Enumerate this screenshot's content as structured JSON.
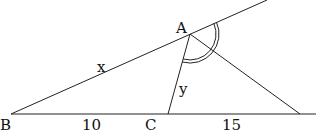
{
  "diagram": {
    "type": "geometry-triangle-angle-bisector",
    "points": {
      "A": {
        "label": "A",
        "x": 190,
        "y": 34
      },
      "B": {
        "label": "B",
        "x": 11,
        "y": 114
      },
      "C": {
        "label": "C",
        "x": 168,
        "y": 114
      },
      "D": {
        "label": "",
        "x": 300,
        "y": 114
      }
    },
    "segment_labels": {
      "BA": "x",
      "AC": "y",
      "BC": "10",
      "CD": "15"
    },
    "angle_marks": {
      "exterior_at_A": "double-arc"
    },
    "colors": {
      "line": "#222222",
      "text": "#111111",
      "background": "#ffffff"
    }
  }
}
